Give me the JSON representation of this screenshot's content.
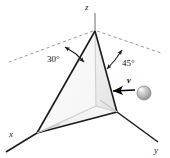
{
  "figure": {
    "background_color": "#ffffff",
    "line_color": "#1a1a1a",
    "dashed_color": "#8c8c99",
    "axis_z_color": "#9a9a9a"
  },
  "axes": [
    {
      "name": "x",
      "label": "x"
    },
    {
      "name": "y",
      "label": "y"
    },
    {
      "name": "z",
      "label": "z"
    }
  ],
  "angles": [
    {
      "name": "left-angle",
      "label": "30°",
      "value": 30,
      "unit": "degrees"
    },
    {
      "name": "right-angle",
      "label": "45°",
      "value": 45,
      "unit": "degrees"
    }
  ],
  "vectors": [
    {
      "name": "velocity",
      "label": "v",
      "direction": "left"
    }
  ],
  "objects": [
    {
      "name": "ball",
      "shape": "sphere",
      "color": "#b0b0b0"
    },
    {
      "name": "pyramid",
      "shape": "triangular-pyramid",
      "face_left_color": "#fbfbfb",
      "face_right_color": "#eeeeee"
    }
  ]
}
